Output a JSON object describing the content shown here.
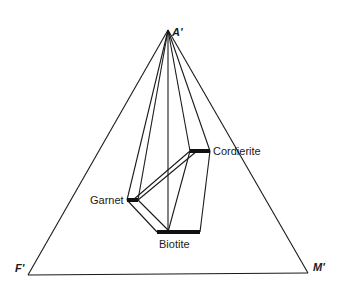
{
  "diagram": {
    "type": "AFM ternary phase diagram",
    "vertices": {
      "top": {
        "label": "A'",
        "x": 168,
        "y": 30
      },
      "left": {
        "label": "F'",
        "x": 28,
        "y": 275
      },
      "right": {
        "label": "M'",
        "x": 308,
        "y": 273
      }
    },
    "phases": [
      {
        "name": "Garnet",
        "label": "Garnet",
        "bar": {
          "x1": 127,
          "x2": 138,
          "y": 200
        },
        "label_pos": {
          "x": 90,
          "y": 204
        }
      },
      {
        "name": "Cordierite",
        "label": "Cordierite",
        "bar": {
          "x1": 190,
          "x2": 210,
          "y": 151
        },
        "label_pos": {
          "x": 213,
          "y": 155
        }
      },
      {
        "name": "Biotite",
        "label": "Biotite",
        "bar": {
          "x1": 157,
          "x2": 200,
          "y": 232
        },
        "label_pos": {
          "x": 159,
          "y": 248
        }
      }
    ],
    "line_color": "#1a1a1a"
  }
}
